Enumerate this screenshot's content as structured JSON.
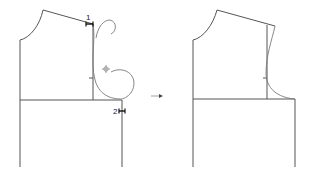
{
  "diagram": {
    "before": {
      "markers": [
        {
          "id": "1",
          "label": "1"
        },
        {
          "id": "2",
          "label": "2"
        }
      ],
      "cursor_icon": "crosshair-cursor-icon"
    },
    "transition_arrow": "right-arrow-icon",
    "after": {}
  },
  "colors": {
    "line": "#555555",
    "marker": "#111111",
    "background": "#ffffff"
  }
}
